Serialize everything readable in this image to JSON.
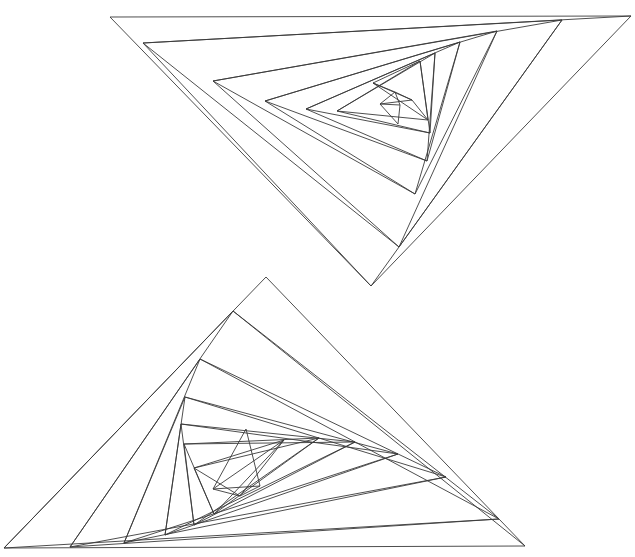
{
  "caption": "",
  "colors": {
    "stroke": "#3a3a3a",
    "background": "#ffffff"
  },
  "figures": [
    {
      "name": "upper-spiral-triangle",
      "outer": [
        [
          110,
          17
        ],
        [
          631,
          16
        ],
        [
          371,
          286
        ]
      ],
      "spiral": [
        [
          110,
          17
        ],
        [
          631,
          16
        ],
        [
          371,
          286
        ],
        [
          143,
          43
        ],
        [
          562,
          20
        ],
        [
          399,
          247
        ],
        [
          213,
          81
        ],
        [
          497,
          31
        ],
        [
          415,
          194
        ],
        [
          265,
          101
        ],
        [
          460,
          42
        ],
        [
          427,
          161
        ],
        [
          306,
          109
        ],
        [
          435,
          53
        ],
        [
          430,
          133
        ],
        [
          337,
          111
        ],
        [
          420,
          61
        ],
        [
          428,
          120
        ],
        [
          373,
          83
        ],
        [
          412,
          100
        ],
        [
          395,
          92
        ],
        [
          380,
          104
        ],
        [
          400,
          105
        ],
        [
          398,
          124
        ]
      ]
    },
    {
      "name": "lower-spiral-triangle",
      "outer": [
        [
          266,
          277
        ],
        [
          525,
          546
        ],
        [
          4,
          548
        ]
      ],
      "spiral": [
        [
          266,
          277
        ],
        [
          525,
          546
        ],
        [
          4,
          548
        ],
        [
          233,
          311
        ],
        [
          499,
          519
        ],
        [
          70,
          547
        ],
        [
          200,
          359
        ],
        [
          446,
          477
        ],
        [
          124,
          543
        ],
        [
          185,
          397
        ],
        [
          398,
          454
        ],
        [
          165,
          535
        ],
        [
          181,
          424
        ],
        [
          355,
          442
        ],
        [
          194,
          525
        ],
        [
          184,
          444
        ],
        [
          319,
          438
        ],
        [
          214,
          514
        ],
        [
          194,
          468
        ],
        [
          284,
          440
        ],
        [
          240,
          496
        ],
        [
          213,
          489
        ],
        [
          260,
          486
        ],
        [
          246,
          429
        ]
      ]
    }
  ]
}
